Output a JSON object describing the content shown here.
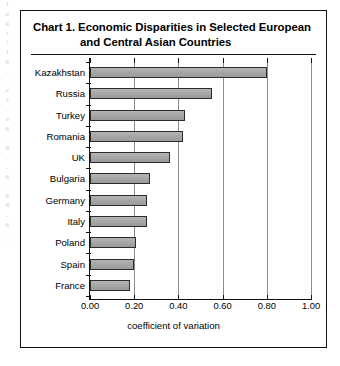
{
  "margin_artifact": {
    "glyphs": [
      "1",
      "a",
      "g",
      "t",
      "|",
      "1",
      "6",
      ".",
      ".",
      "e",
      "s",
      ".",
      "e",
      "8",
      ".",
      "8",
      ".",
      ".",
      "8",
      ".",
      "6",
      "8",
      ".",
      "8",
      ".",
      "."
    ]
  },
  "chart_box": {
    "title_line_1": "Chart 1.  Economic Disparities in Selected European",
    "title_line_2": "and Central Asian Countries"
  },
  "chart_data": {
    "type": "bar",
    "orientation": "horizontal",
    "title": "Chart 1.  Economic Disparities in Selected European and Central Asian Countries",
    "xlabel": "coefficient of variation",
    "ylabel": "",
    "xlim": [
      0.0,
      1.0
    ],
    "xticks": [
      0.0,
      0.2,
      0.4,
      0.6,
      0.8,
      1.0
    ],
    "xtick_labels": [
      "0.00",
      "0.20",
      "0.40",
      "0.60",
      "0.80",
      "1.00"
    ],
    "grid": "vertical",
    "legend": "none",
    "bar_color": "#a9a9a9",
    "bar_edge_color": "#2b2b2b",
    "categories": [
      "Kazakhstan",
      "Russia",
      "Turkey",
      "Romania",
      "UK",
      "Bulgaria",
      "Germany",
      "Italy",
      "Poland",
      "Spain",
      "France"
    ],
    "values": [
      0.8,
      0.55,
      0.43,
      0.42,
      0.36,
      0.27,
      0.26,
      0.26,
      0.21,
      0.2,
      0.18
    ]
  }
}
